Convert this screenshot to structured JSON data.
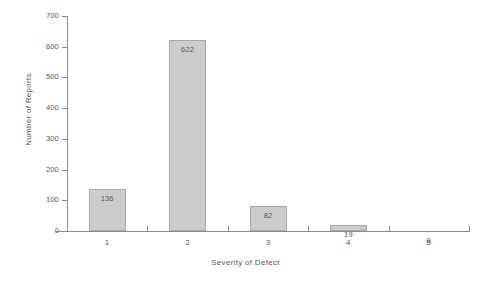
{
  "chart_data": {
    "type": "bar",
    "title": "",
    "xlabel": "Severity of Defect",
    "ylabel": "Number of Reports",
    "categories": [
      "1",
      "2",
      "3",
      "4",
      "5"
    ],
    "values": [
      136,
      622,
      82,
      19,
      0
    ],
    "value_labels": [
      "136",
      "622",
      "82",
      "19",
      "0"
    ],
    "ylim": [
      0,
      700
    ],
    "yticks": [
      0,
      100,
      200,
      300,
      400,
      500,
      600,
      700
    ],
    "ytick_labels": [
      "0",
      "100",
      "200",
      "300",
      "400",
      "500",
      "600",
      "700"
    ],
    "grid": false,
    "legend": null,
    "bar_fill_color": "#cccccc",
    "bar_edge_color": "#a8a8a8",
    "axis_color": "#8b8b8d",
    "text_color": "#58585a",
    "background_color": "#ffffff"
  }
}
